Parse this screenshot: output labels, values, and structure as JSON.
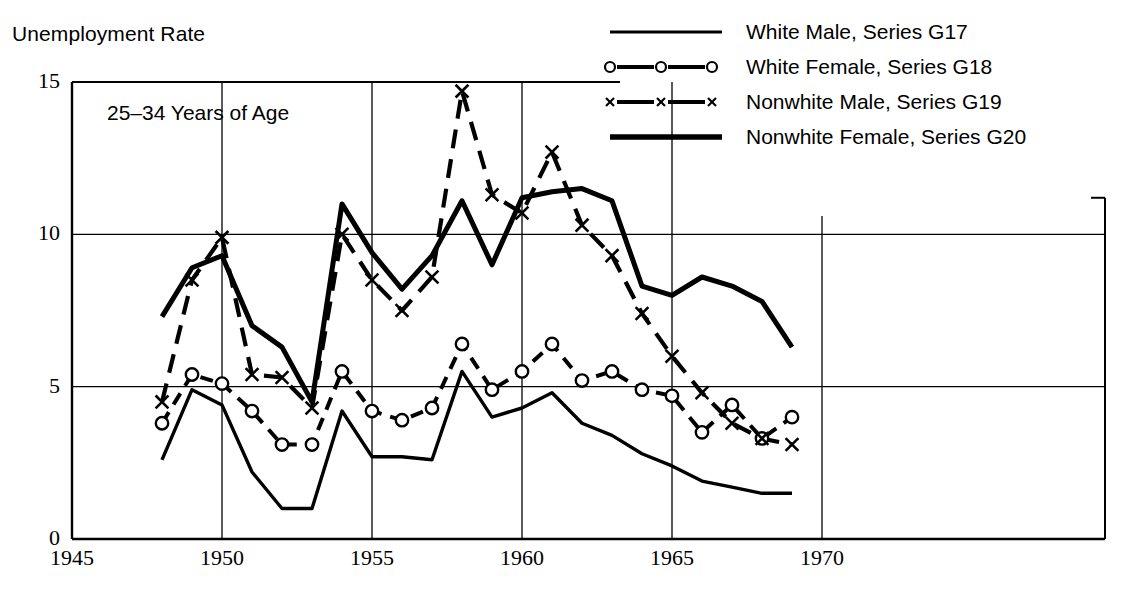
{
  "chart_data": {
    "type": "line",
    "title": "Unemployment Rate",
    "panel_label": "25–34 Years of Age",
    "xlabel": "",
    "ylabel": "Unemployment Rate",
    "xlim": [
      1945,
      1970.5
    ],
    "ylim": [
      0,
      15
    ],
    "xticks": [
      "1945",
      "1950",
      "1955",
      "1960",
      "1965",
      "1970"
    ],
    "xtick_values": [
      1945,
      1950,
      1955,
      1960,
      1965,
      1970
    ],
    "yticks": [
      "0",
      "5",
      "10",
      "15"
    ],
    "ytick_values": [
      0,
      5,
      10,
      15
    ],
    "grid": true,
    "legend_position": "top-right",
    "x": [
      1948,
      1949,
      1950,
      1951,
      1952,
      1953,
      1954,
      1955,
      1956,
      1957,
      1958,
      1959,
      1960,
      1961,
      1962,
      1963,
      1964,
      1965,
      1966,
      1967,
      1968,
      1969
    ],
    "series": [
      {
        "name": "White Male, Series G17",
        "style": "solid-thin",
        "marker": "none",
        "values": [
          2.6,
          4.9,
          4.4,
          2.2,
          1.0,
          1.0,
          4.2,
          2.7,
          2.7,
          2.6,
          5.5,
          4.0,
          4.3,
          4.8,
          3.8,
          3.4,
          2.8,
          2.4,
          1.9,
          1.7,
          1.5,
          1.5
        ]
      },
      {
        "name": "White Female, Series G18",
        "style": "dashed",
        "marker": "circle",
        "values": [
          3.8,
          5.4,
          5.1,
          4.2,
          3.1,
          3.1,
          5.5,
          4.2,
          3.9,
          4.3,
          6.4,
          4.9,
          5.5,
          6.4,
          5.2,
          5.5,
          4.9,
          4.7,
          3.5,
          4.4,
          3.3,
          4.0
        ]
      },
      {
        "name": "Nonwhite Male, Series G19",
        "style": "dash-dot",
        "marker": "x",
        "values": [
          4.5,
          8.5,
          9.9,
          5.4,
          5.3,
          4.3,
          10.0,
          8.5,
          7.5,
          8.6,
          14.7,
          11.3,
          10.7,
          12.7,
          10.3,
          9.3,
          7.4,
          6.0,
          4.8,
          3.8,
          3.3,
          3.1
        ]
      },
      {
        "name": "Nonwhite Female, Series G20",
        "style": "solid-thick",
        "marker": "none",
        "values": [
          7.3,
          8.9,
          9.3,
          7.0,
          6.3,
          4.5,
          11.0,
          9.4,
          8.2,
          9.3,
          11.1,
          9.0,
          11.2,
          11.4,
          11.5,
          11.1,
          8.3,
          8.0,
          8.6,
          8.3,
          7.8,
          6.3
        ]
      }
    ]
  },
  "legend": {
    "entries": [
      {
        "label": "White Male, Series G17",
        "sample": "solid-thin-line"
      },
      {
        "label": "White Female, Series G18",
        "sample": "dashed-circle-line"
      },
      {
        "label": "Nonwhite Male, Series G19",
        "sample": "dashed-x-line"
      },
      {
        "label": "Nonwhite Female, Series G20",
        "sample": "solid-thick-line"
      }
    ]
  }
}
